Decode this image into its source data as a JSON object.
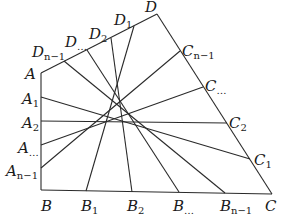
{
  "diagram": {
    "corners": {
      "A": {
        "x": 41,
        "y": 73
      },
      "B": {
        "x": 41,
        "y": 190
      },
      "C": {
        "x": 272,
        "y": 194
      },
      "D": {
        "x": 157,
        "y": 14
      }
    },
    "left_edge_points": [
      {
        "name": "A",
        "base": "A",
        "sub": "",
        "x": 41,
        "y": 73,
        "lx": 25,
        "ly": 79
      },
      {
        "name": "A1",
        "base": "A",
        "sub": "1",
        "x": 41,
        "y": 97,
        "lx": 22,
        "ly": 104
      },
      {
        "name": "A2",
        "base": "A",
        "sub": "2",
        "x": 41,
        "y": 121,
        "lx": 22,
        "ly": 128
      },
      {
        "name": "A...",
        "base": "A",
        "sub": "...",
        "x": 41,
        "y": 145,
        "lx": 18,
        "ly": 153
      },
      {
        "name": "An-1",
        "base": "A",
        "sub": "n−1",
        "x": 41,
        "y": 168,
        "lx": 6,
        "ly": 176
      }
    ],
    "bottom_edge_points": [
      {
        "name": "B",
        "base": "B",
        "sub": "",
        "x": 41,
        "y": 190,
        "lx": 41,
        "ly": 211
      },
      {
        "name": "B1",
        "base": "B",
        "sub": "1",
        "x": 86,
        "y": 191,
        "lx": 81,
        "ly": 211
      },
      {
        "name": "B2",
        "base": "B",
        "sub": "2",
        "x": 132,
        "y": 192,
        "lx": 127,
        "ly": 211
      },
      {
        "name": "B...",
        "base": "B",
        "sub": "...",
        "x": 179,
        "y": 192,
        "lx": 173,
        "ly": 211
      },
      {
        "name": "Bn-1",
        "base": "B",
        "sub": "n−1",
        "x": 225,
        "y": 193,
        "lx": 220,
        "ly": 211
      },
      {
        "name": "C",
        "base": "C",
        "sub": "",
        "x": 272,
        "y": 194,
        "lx": 265,
        "ly": 211
      }
    ],
    "top_edge_points": [
      {
        "name": "Dn-1",
        "base": "D",
        "sub": "n−1",
        "x": 64,
        "y": 61,
        "lx": 32,
        "ly": 57
      },
      {
        "name": "D...",
        "base": "D",
        "sub": "...",
        "x": 87,
        "y": 50,
        "lx": 65,
        "ly": 47
      },
      {
        "name": "D2",
        "base": "D",
        "sub": "2",
        "x": 111,
        "y": 38,
        "lx": 89,
        "ly": 39
      },
      {
        "name": "D1",
        "base": "D",
        "sub": "1",
        "x": 134,
        "y": 26,
        "lx": 114,
        "ly": 25
      },
      {
        "name": "D",
        "base": "D",
        "sub": "",
        "x": 157,
        "y": 14,
        "lx": 145,
        "ly": 12
      }
    ],
    "right_edge_points": [
      {
        "name": "Cn-1",
        "base": "C",
        "sub": "n−1",
        "x": 180,
        "y": 51,
        "lx": 182,
        "ly": 56
      },
      {
        "name": "C...",
        "base": "C",
        "sub": "...",
        "x": 203,
        "y": 87,
        "lx": 205,
        "ly": 91
      },
      {
        "name": "C2",
        "base": "C",
        "sub": "2",
        "x": 227,
        "y": 123,
        "lx": 229,
        "ly": 128
      },
      {
        "name": "C1",
        "base": "C",
        "sub": "1",
        "x": 250,
        "y": 159,
        "lx": 254,
        "ly": 165
      }
    ],
    "grid_lines": {
      "horizontal": [
        {
          "from": "A1",
          "to": "C1"
        },
        {
          "from": "A2",
          "to": "C2"
        },
        {
          "from": "A...",
          "to": "C..."
        },
        {
          "from": "An-1",
          "to": "Cn-1"
        }
      ],
      "vertical": [
        {
          "from": "B1",
          "to": "D1"
        },
        {
          "from": "B2",
          "to": "D2"
        },
        {
          "from": "B...",
          "to": "D..."
        },
        {
          "from": "Bn-1",
          "to": "Dn-1"
        }
      ]
    },
    "line_color": "#2a2a2a",
    "background": "#ffffff"
  }
}
